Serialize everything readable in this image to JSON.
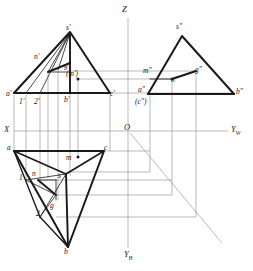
{
  "figure": {
    "type": "orthographic-three-view-projection",
    "background": "#ffffff",
    "stroke_dark": "#1a1a1a",
    "stroke_light": "#8c8c8c",
    "width": 253,
    "height": 271
  },
  "axes": {
    "origin": {
      "label": "O",
      "x": 128,
      "y": 131
    },
    "x_axis": {
      "label": "X",
      "x": 8,
      "y": 131
    },
    "z_axis": {
      "label": "Z",
      "x": 126,
      "y": 10
    },
    "yw_axis": {
      "label": "Y",
      "sub": "W",
      "x": 232,
      "y": 131
    },
    "yh_axis": {
      "label": "Y",
      "sub": "H",
      "x": 126,
      "y": 254
    }
  },
  "front_view": {
    "name": "V-projection (front view)",
    "points": [
      {
        "id": "s-prime",
        "label": "s'",
        "x": 68,
        "y": 30
      },
      {
        "id": "a-prime",
        "label": "a'",
        "x": 9,
        "y": 95
      },
      {
        "id": "b-prime",
        "label": "b'",
        "x": 66,
        "y": 95
      },
      {
        "id": "c-prime",
        "label": "c'",
        "x": 112,
        "y": 95
      },
      {
        "id": "n-prime",
        "label": "n'",
        "x": 37,
        "y": 57
      },
      {
        "id": "g-prime",
        "label": "g'",
        "x": 67,
        "y": 66
      },
      {
        "id": "m-prime",
        "label": "(m')",
        "x": 69,
        "y": 74
      },
      {
        "id": "one-prime",
        "label": "1'",
        "x": 21,
        "y": 101
      },
      {
        "id": "two-prime",
        "label": "2'",
        "x": 36,
        "y": 101
      }
    ]
  },
  "side_view": {
    "name": "W-projection (left side view)",
    "points": [
      {
        "id": "s-dprime",
        "label": "s\"",
        "x": 178,
        "y": 29
      },
      {
        "id": "a-dprime",
        "label": "a\"",
        "x": 141,
        "y": 91
      },
      {
        "id": "c-dprime",
        "label": "(c\")",
        "x": 139,
        "y": 103
      },
      {
        "id": "b-dprime",
        "label": "b\"",
        "x": 238,
        "y": 93
      },
      {
        "id": "m-dprime",
        "label": "m\"",
        "x": 147,
        "y": 71
      },
      {
        "id": "n-dprime",
        "label": "n\"",
        "x": 175,
        "y": 76
      },
      {
        "id": "g-dprime",
        "label": "g\"",
        "x": 196,
        "y": 70
      }
    ]
  },
  "top_view": {
    "name": "H-projection (top view)",
    "points": [
      {
        "id": "a",
        "label": "a",
        "x": 9,
        "y": 148
      },
      {
        "id": "c",
        "label": "c",
        "x": 106,
        "y": 148
      },
      {
        "id": "b",
        "label": "b",
        "x": 61,
        "y": 251
      },
      {
        "id": "s",
        "label": "s",
        "x": 60,
        "y": 176
      },
      {
        "id": "n",
        "label": "n",
        "x": 34,
        "y": 173
      },
      {
        "id": "g",
        "label": "g",
        "x": 51,
        "y": 206
      },
      {
        "id": "m",
        "label": "m",
        "x": 68,
        "y": 158
      },
      {
        "id": "one",
        "label": "1",
        "x": 21,
        "y": 177
      },
      {
        "id": "two",
        "label": "2",
        "x": 38,
        "y": 213
      }
    ]
  },
  "geometry": {
    "front_triangle": "a'(14,93) b'(70,93) c'(110,93) s'(70,32)",
    "side_triangle": "a\"(148,94) b\"(234,94) s\"(182,36)",
    "top_triangle": "a(14,151) c(104,151) b(68,247) s(66,174)"
  }
}
